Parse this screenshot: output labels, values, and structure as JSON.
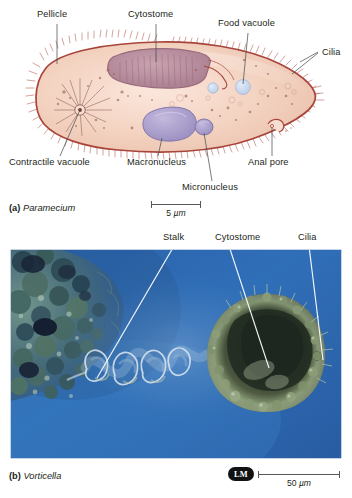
{
  "figure": {
    "panels": [
      {
        "id": "a",
        "tag": "(a)",
        "organism": "Paramecium",
        "labels": [
          {
            "name": "pellicle",
            "text": "Pellicle"
          },
          {
            "name": "cytostome",
            "text": "Cytostome"
          },
          {
            "name": "food-vacuole",
            "text": "Food vacuole"
          },
          {
            "name": "cilia",
            "text": "Cilia"
          },
          {
            "name": "contractile-vacuole",
            "text": "Contractile vacuole"
          },
          {
            "name": "macronucleus",
            "text": "Macronucleus"
          },
          {
            "name": "micronucleus",
            "text": "Micronucleus"
          },
          {
            "name": "anal-pore",
            "text": "Anal pore"
          }
        ],
        "scalebar": {
          "value": "5",
          "unit": "µm"
        }
      },
      {
        "id": "b",
        "tag": "(b)",
        "organism": "Vorticella",
        "labels": [
          {
            "name": "stalk",
            "text": "Stalk"
          },
          {
            "name": "cytostome",
            "text": "Cytostome"
          },
          {
            "name": "cilia",
            "text": "Cilia"
          }
        ],
        "micrograph_badge": "LM",
        "scalebar": {
          "value": "50",
          "unit": "µm"
        }
      }
    ]
  },
  "colors": {
    "cell_outline": "#a8453a",
    "cytoplasm": "#f0cdbb",
    "cytostome": "#b9899a",
    "nucleus": "#a89cc8",
    "food_vacuole": "#c5d4ea",
    "photo_background": "#2f6bb5",
    "leader_line": "#4c5256",
    "badge_background": "#111214"
  }
}
